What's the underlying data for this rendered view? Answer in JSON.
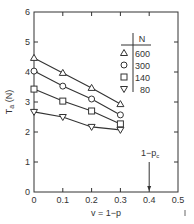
{
  "chart_data": {
    "type": "line",
    "title": "",
    "xlabel": "v = 1−p",
    "ylabel": "T_a (N)",
    "xlim": [
      0,
      0.5
    ],
    "ylim": [
      0,
      6
    ],
    "x_ticks": [
      "0",
      "0.1",
      "0.2",
      "0.3",
      "0.4",
      "0.5"
    ],
    "y_ticks": [
      "0",
      "1",
      "2",
      "3",
      "4",
      "5",
      "6"
    ],
    "grid": false,
    "legend_title": "N",
    "legend_position": "upper right (inside)",
    "x": [
      0,
      0.1,
      0.2,
      0.3
    ],
    "series": [
      {
        "name": "600",
        "marker": "triangle-up",
        "values": [
          4.47,
          3.97,
          3.47,
          2.93
        ]
      },
      {
        "name": "300",
        "marker": "circle",
        "values": [
          4.03,
          3.53,
          3.1,
          2.57
        ]
      },
      {
        "name": "140",
        "marker": "square",
        "values": [
          3.43,
          3.03,
          2.7,
          2.27
        ]
      },
      {
        "name": "80",
        "marker": "triangle-down",
        "values": [
          2.67,
          2.5,
          2.17,
          2.07
        ]
      }
    ],
    "annotations": [
      {
        "text": "1−p",
        "subscript": "c",
        "x": 0.4,
        "type": "arrow-down"
      }
    ]
  }
}
